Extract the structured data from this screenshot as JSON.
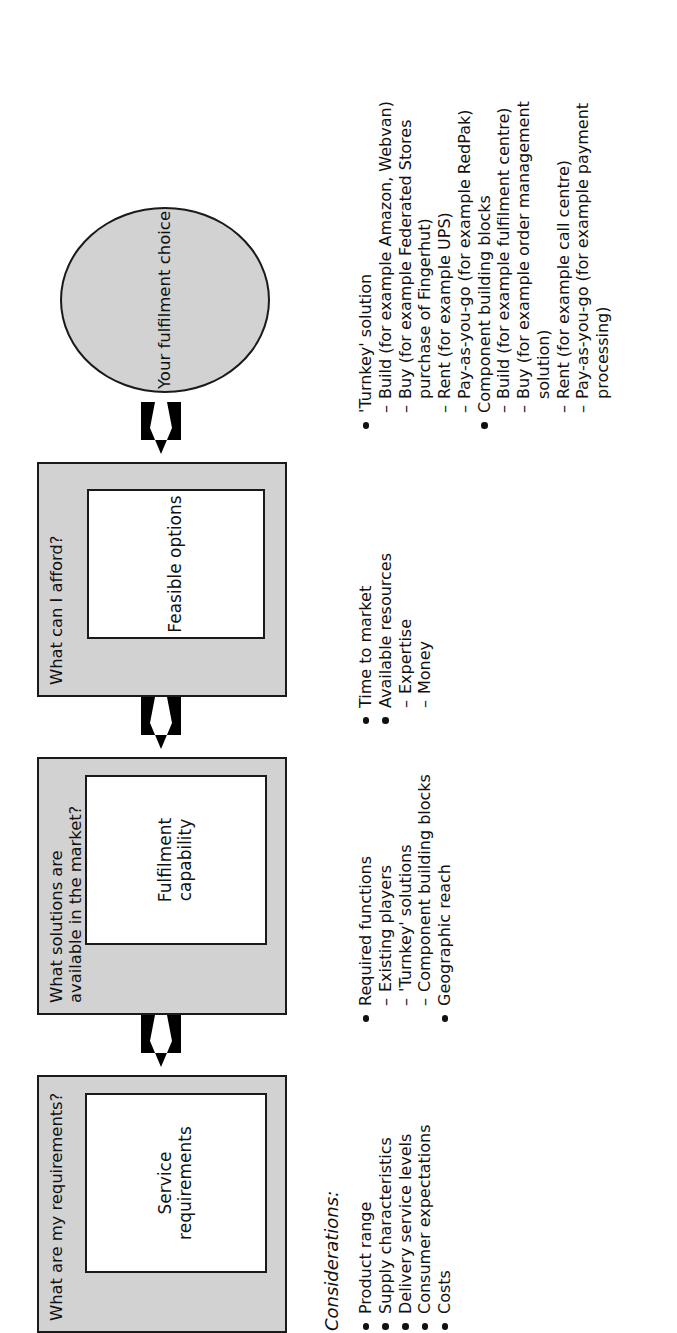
{
  "diagram": {
    "title_note": "Considerations:",
    "stages": [
      {
        "question": "What are my requirements?",
        "label": "Service requirements"
      },
      {
        "question": "What solutions are available in the market?",
        "label": "Fulfilment capability"
      },
      {
        "question": "What can I afford?",
        "label": "Feasible options"
      }
    ],
    "outcome": {
      "label": "Your fulfilment choice"
    },
    "arrows": [
      {
        "name": "arrow-requirements-to-capability"
      },
      {
        "name": "arrow-capability-to-options"
      },
      {
        "name": "arrow-options-to-choice"
      }
    ],
    "colors": {
      "stage_fill": "#d2d2d2",
      "inner_fill": "#ffffff",
      "stroke": "#1a1a1a",
      "arrow_fill": "#000000",
      "text": "#111111",
      "page_background": "#ffffff"
    }
  },
  "considerations": [
    {
      "group": "requirements",
      "items": [
        {
          "kind": "bullet",
          "text": "Product range"
        },
        {
          "kind": "bullet",
          "text": "Supply characteristics"
        },
        {
          "kind": "bullet",
          "text": "Delivery service levels"
        },
        {
          "kind": "bullet",
          "text": "Consumer expectations"
        },
        {
          "kind": "bullet",
          "text": "Costs"
        }
      ]
    },
    {
      "group": "market-solutions",
      "items": [
        {
          "kind": "bullet",
          "text": "Required functions"
        },
        {
          "kind": "dash",
          "text": "Existing players"
        },
        {
          "kind": "dash",
          "text": "'Turnkey' solutions"
        },
        {
          "kind": "dash",
          "text": "Component building blocks"
        },
        {
          "kind": "bullet",
          "text": "Geographic reach"
        }
      ]
    },
    {
      "group": "affordability",
      "items": [
        {
          "kind": "bullet",
          "text": "Time to market"
        },
        {
          "kind": "bullet",
          "text": "Available resources"
        },
        {
          "kind": "dash",
          "text": "Expertise"
        },
        {
          "kind": "dash",
          "text": "Money"
        }
      ]
    },
    {
      "group": "fulfilment-choice",
      "items": [
        {
          "kind": "bullet",
          "text": "'Turnkey' solution"
        },
        {
          "kind": "dash",
          "text": "Build (for example Amazon, Webvan)"
        },
        {
          "kind": "dash",
          "text": "Buy (for example Federated Stores"
        },
        {
          "kind": "cont",
          "text": "purchase of Fingerhut)"
        },
        {
          "kind": "dash",
          "text": "Rent (for example UPS)"
        },
        {
          "kind": "dash",
          "text": "Pay-as-you-go (for example RedPak)"
        },
        {
          "kind": "bullet",
          "text": "Component building blocks"
        },
        {
          "kind": "dash",
          "text": "Build (for example fulfilment centre)"
        },
        {
          "kind": "dash",
          "text": "Buy (for example order management"
        },
        {
          "kind": "cont",
          "text": "solution)"
        },
        {
          "kind": "dash",
          "text": "Rent (for example call centre)"
        },
        {
          "kind": "dash",
          "text": "Pay-as-you-go (for example payment"
        },
        {
          "kind": "cont",
          "text": "processing)"
        }
      ]
    }
  ]
}
